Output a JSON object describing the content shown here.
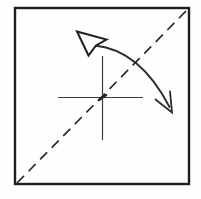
{
  "canvas": {
    "width": 201,
    "height": 199,
    "background": "#fefefe"
  },
  "colors": {
    "ink": "#262626",
    "paper": "#ffffff"
  },
  "diagram": {
    "kind": "origami-step",
    "elements": [
      {
        "name": "paper-square",
        "type": "rect",
        "x": 15,
        "y": 8,
        "width": 174,
        "height": 176,
        "stroke": "#1f1f1f",
        "strokeWidth": 2.4,
        "fill": "none",
        "linejoin": "miter"
      },
      {
        "name": "diagonal-valley-fold-line",
        "type": "line",
        "x1": 17,
        "y1": 183,
        "x2": 188,
        "y2": 9,
        "stroke": "#2b2b2b",
        "strokeWidth": 1.7,
        "dash": "10 6.5"
      },
      {
        "name": "center-crease-horizontal",
        "type": "line",
        "x1": 58,
        "y1": 97.5,
        "x2": 143,
        "y2": 97.5,
        "stroke": "#3c3c3c",
        "strokeWidth": 1.2
      },
      {
        "name": "center-crease-vertical",
        "type": "line",
        "x1": 102.5,
        "y1": 56,
        "x2": 102.5,
        "y2": 140,
        "stroke": "#3c3c3c",
        "strokeWidth": 1.2
      },
      {
        "name": "center-crease-node",
        "type": "path",
        "d": "M 99,100 L 106,95",
        "stroke": "#262626",
        "strokeWidth": 2.6,
        "fill": "none",
        "linecap": "round"
      },
      {
        "name": "fold-arrow-arc",
        "type": "path",
        "d": "M 95,45.5 Q 140,50 169.5,107",
        "stroke": "#2b2b2b",
        "strokeWidth": 1.8,
        "fill": "none",
        "linecap": "round"
      },
      {
        "name": "fold-arrow-hollow-head",
        "type": "path",
        "d": "M 77,31.5 L 106.5,39.5 L 96,45.5 L 88.5,55.5 Z",
        "stroke": "#1f1f1f",
        "strokeWidth": 2,
        "fill": "#ffffff",
        "linejoin": "miter"
      },
      {
        "name": "fold-arrow-open-head",
        "type": "path",
        "d": "M 155.5,99.5 L 172,112.5 L 170,91.5",
        "stroke": "#2b2b2b",
        "strokeWidth": 1.8,
        "fill": "none",
        "linecap": "round",
        "linejoin": "miter"
      }
    ]
  }
}
